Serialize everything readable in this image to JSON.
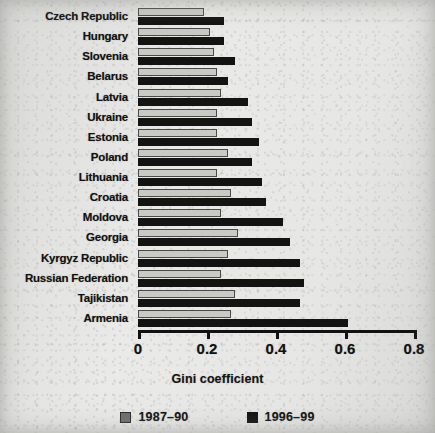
{
  "chart_data": {
    "type": "bar",
    "orientation": "horizontal",
    "title": "",
    "xlabel": "Gini coefficient",
    "ylabel": "",
    "xlim": [
      0,
      0.8
    ],
    "xticks": [
      "0",
      "0.2",
      "0.4",
      "0.6",
      "0.8"
    ],
    "xtick_values": [
      0,
      0.2,
      0.4,
      0.6,
      0.8
    ],
    "grid": false,
    "legend_position": "bottom",
    "categories": [
      "Czech Republic",
      "Hungary",
      "Slovenia",
      "Belarus",
      "Latvia",
      "Ukraine",
      "Estonia",
      "Poland",
      "Lithuania",
      "Croatia",
      "Moldova",
      "Georgia",
      "Kyrgyz Republic",
      "Russian Federation",
      "Tajikistan",
      "Armenia"
    ],
    "series": [
      {
        "name": "1987–90",
        "color": "#c9c9c6",
        "values": [
          0.19,
          0.21,
          0.22,
          0.23,
          0.24,
          0.23,
          0.23,
          0.26,
          0.23,
          0.27,
          0.24,
          0.29,
          0.26,
          0.24,
          0.28,
          0.27
        ]
      },
      {
        "name": "1996–99",
        "color": "#131313",
        "values": [
          0.25,
          0.25,
          0.28,
          0.26,
          0.32,
          0.33,
          0.35,
          0.33,
          0.36,
          0.37,
          0.42,
          0.44,
          0.47,
          0.48,
          0.47,
          0.61
        ]
      }
    ]
  },
  "legend": {
    "items": [
      {
        "label": "1987–90",
        "swatch": "old"
      },
      {
        "label": "1996–99",
        "swatch": "new"
      }
    ]
  },
  "axis": {
    "x_title": "Gini coefficient"
  }
}
